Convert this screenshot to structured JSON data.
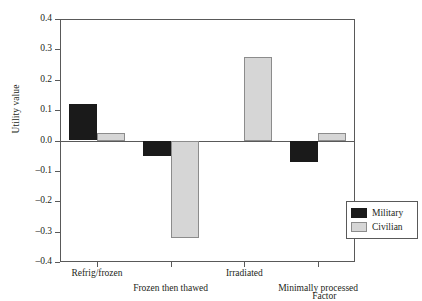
{
  "chart_data": {
    "type": "bar",
    "title": "",
    "subtitle": "",
    "xlabel": "Factor",
    "ylabel": "Utility value",
    "categories": [
      "Refrig/frozen",
      "Frozen then thawed",
      "Irradiated",
      "Minimally processed"
    ],
    "series": [
      {
        "name": "Military",
        "color": "#1a1a1a",
        "values": [
          0.12,
          -0.05,
          0.0,
          -0.07
        ]
      },
      {
        "name": "Civilian",
        "color": "#d6d6d6",
        "values": [
          0.025,
          -0.32,
          0.275,
          0.025
        ]
      }
    ],
    "ylim": [
      -0.4,
      0.4
    ],
    "yticks": [
      "0.4",
      "0.3",
      "0.2",
      "0.1",
      "0.0",
      "–0.1",
      "–0.2",
      "–0.3",
      "–0.4"
    ],
    "ytick_values": [
      0.4,
      0.3,
      0.2,
      0.1,
      0.0,
      -0.1,
      -0.2,
      -0.3,
      -0.4
    ],
    "grid": false,
    "legend_position": "bottom-right",
    "legend_entries": [
      "Military",
      "Civilian"
    ],
    "annotations": []
  },
  "axis": {
    "y_title": "Utility value",
    "x_title": "Factor"
  },
  "legend": {
    "items": [
      {
        "label": "Military",
        "swatch": "black-square-swatch"
      },
      {
        "label": "Civilian",
        "swatch": "gray-square-swatch"
      }
    ]
  }
}
